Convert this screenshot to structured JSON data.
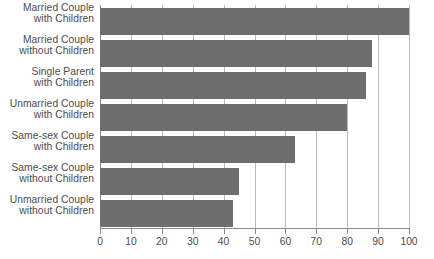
{
  "chart_data": {
    "type": "bar",
    "orientation": "horizontal",
    "title": "",
    "subtitle": "",
    "xlabel": "",
    "ylabel": "",
    "xlim": [
      0,
      100
    ],
    "xticks": [
      0,
      10,
      20,
      30,
      40,
      50,
      60,
      70,
      80,
      90,
      100
    ],
    "xtick_labels": [
      "0",
      "10",
      "20",
      "30",
      "40",
      "50",
      "60",
      "70",
      "80",
      "90",
      "100"
    ],
    "grid": "vertical",
    "legend": "none",
    "categories": [
      "Married Couple with Children",
      "Married Couple without Children",
      "Single Parent with Children",
      "Unmarried Couple with Children",
      "Same-sex Couple with Children",
      "Same-sex Couple without Children",
      "Unmarried Couple without Children"
    ],
    "category_lines": [
      [
        "Married Couple",
        "with Children"
      ],
      [
        "Married Couple",
        "without Children"
      ],
      [
        "Single Parent",
        "with Children"
      ],
      [
        "Unmarried Couple",
        "with Children"
      ],
      [
        "Same-sex Couple",
        "with Children"
      ],
      [
        "Same-sex Couple",
        "without Children"
      ],
      [
        "Unmarried Couple",
        "without Children"
      ]
    ],
    "values": [
      100,
      88,
      86,
      80,
      63,
      45,
      43
    ],
    "bar_color": "#6e6e6e",
    "grid_color": "#b9b9b9",
    "axis_color": "#8a8a8a",
    "text_color": "#4b4b4b",
    "background_color": "#ffffff"
  }
}
